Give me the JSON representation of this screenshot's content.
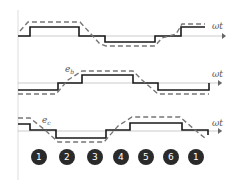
{
  "diagram": {
    "axis_label": "ωt",
    "waveforms": [
      {
        "name": "e_a",
        "label": ""
      },
      {
        "name": "e_b",
        "label": "e_b"
      },
      {
        "name": "e_c",
        "label": "e_c"
      }
    ],
    "sectors": [
      "1",
      "2",
      "3",
      "4",
      "5",
      "6",
      "1"
    ],
    "colors": {
      "solid": "#1a1a1a",
      "dashed": "#777777",
      "circle": "#2a2a2a"
    }
  }
}
